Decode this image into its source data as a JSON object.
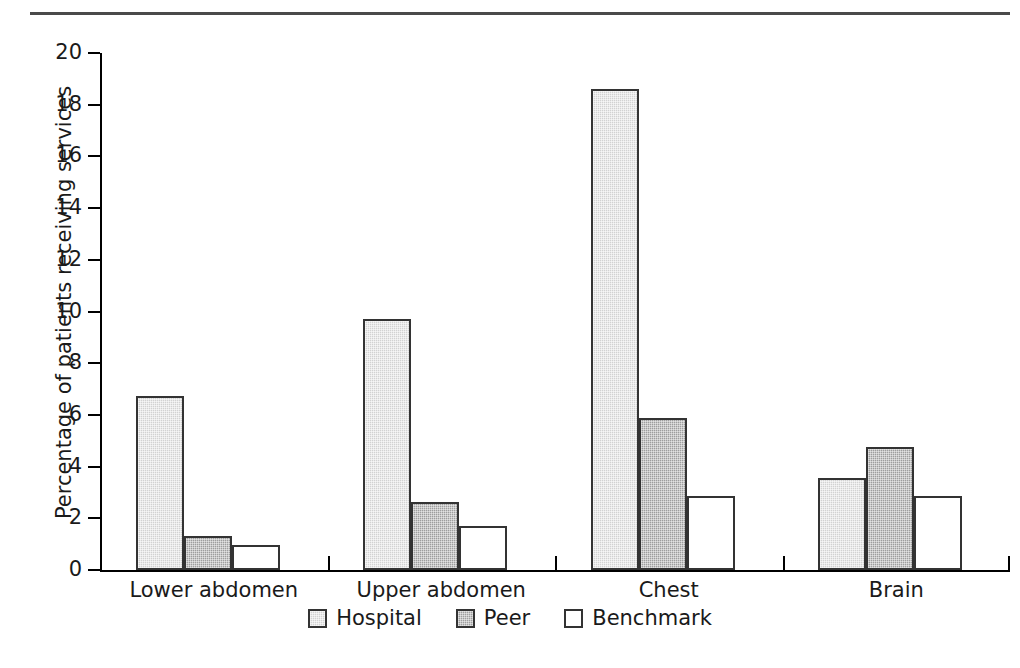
{
  "chart_data": {
    "type": "bar",
    "title": "",
    "subtitle": "",
    "xlabel": "",
    "ylabel": "Percentage of patients receiving services",
    "ylim": [
      0,
      20
    ],
    "ytick_step": 2,
    "yticks": [
      "20",
      "18",
      "16",
      "14",
      "12",
      "10",
      "8",
      "6",
      "4",
      "2",
      "0"
    ],
    "grid": false,
    "legend_position": "bottom-center",
    "categories": [
      "Lower abdomen",
      "Upper abdomen",
      "Chest",
      "Brain"
    ],
    "series": [
      {
        "name": "Hospital",
        "color": "#d2d2d2",
        "values": [
          6.75,
          9.7,
          18.6,
          3.55
        ]
      },
      {
        "name": "Peer",
        "color": "#9e9e9e",
        "values": [
          1.3,
          2.65,
          5.9,
          4.75
        ]
      },
      {
        "name": "Benchmark",
        "color": "#ffffff",
        "values": [
          0.95,
          1.7,
          2.85,
          2.85
        ]
      }
    ]
  },
  "legend": {
    "items": [
      {
        "label": "Hospital",
        "swatch": "light-gray-swatch"
      },
      {
        "label": "Peer",
        "swatch": "dark-gray-swatch"
      },
      {
        "label": "Benchmark",
        "swatch": "white-swatch"
      }
    ]
  },
  "colors": {
    "hospital": "#d2d2d2",
    "peer": "#9e9e9e",
    "benchmark": "#ffffff",
    "axis": "#000000",
    "rule": "#4a4a4a",
    "text": "#1a1a1a"
  }
}
